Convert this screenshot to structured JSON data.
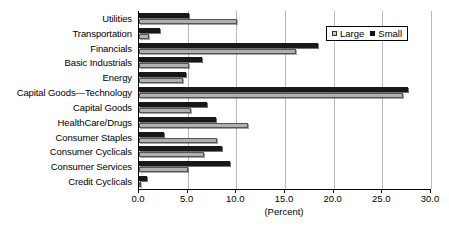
{
  "chart_data": {
    "type": "bar",
    "orientation": "horizontal",
    "title": "",
    "xlabel": "(Percent)",
    "ylabel": "",
    "xlim": [
      0.0,
      30.0
    ],
    "xticks": [
      "0.0",
      "5.0",
      "10.0",
      "15.0",
      "20.0",
      "25.0",
      "30.0"
    ],
    "xtick_values": [
      0.0,
      5.0,
      10.0,
      15.0,
      20.0,
      25.0,
      30.0
    ],
    "grid": "vertical",
    "legend_position": "top-right",
    "categories": [
      "Utilities",
      "Transportation",
      "Financials",
      "Basic Industrials",
      "Energy",
      "Capital Goods—Technology",
      "Capital Goods",
      "HealthCare/Drugs",
      "Consumer Staples",
      "Consumer Cyclicals",
      "Consumer Services",
      "Credit Cyclicals"
    ],
    "series": [
      {
        "name": "Small",
        "color": "#181818",
        "values": [
          5.1,
          2.2,
          18.4,
          6.5,
          4.8,
          27.6,
          7.0,
          7.9,
          2.6,
          8.5,
          9.4,
          0.8
        ]
      },
      {
        "name": "Large",
        "color": "#b0b0b0",
        "values": [
          10.1,
          1.0,
          16.1,
          5.1,
          4.5,
          27.1,
          5.3,
          11.2,
          8.0,
          6.7,
          5.0,
          0.1
        ]
      }
    ]
  },
  "legend": {
    "entries": [
      {
        "label": "Large",
        "swatch": "swatch-large"
      },
      {
        "label": "Small",
        "swatch": "swatch-small"
      }
    ]
  },
  "axis": {
    "x_title": "(Percent)"
  }
}
